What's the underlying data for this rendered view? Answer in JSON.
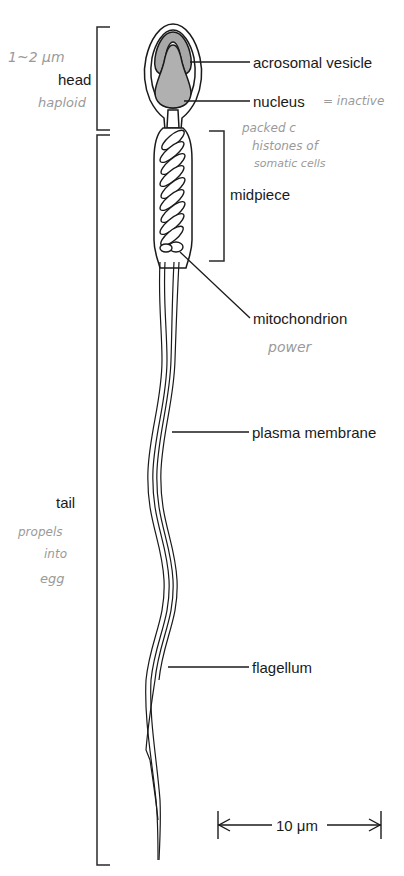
{
  "diagram": {
    "type": "anatomical-labelled-diagram",
    "region_labels": {
      "head": "head",
      "midpiece": "midpiece",
      "tail": "tail"
    },
    "structure_labels": {
      "acrosomal_vesicle": "acrosomal vesicle",
      "nucleus": "nucleus",
      "mitochondrion": "mitochondrion",
      "plasma_membrane": "plasma membrane",
      "flagellum": "flagellum"
    },
    "scale_bar": {
      "label": "10 μm"
    },
    "handwritten_notes": {
      "head_size": "1~2 μm",
      "head_note": "haploid",
      "nucleus_note": "= inactive",
      "nucleus_note_2": "packed c",
      "nucleus_note_3": "histones of",
      "nucleus_note_4": "somatic cells",
      "mitochondrion_note": "power",
      "tail_note_1": "propels",
      "tail_note_2": "into",
      "tail_note_3": "egg"
    },
    "colors": {
      "line": "#1a1a1a",
      "fill_gray": "#a8a8a8",
      "handwriting": "#9a9a9a"
    }
  }
}
